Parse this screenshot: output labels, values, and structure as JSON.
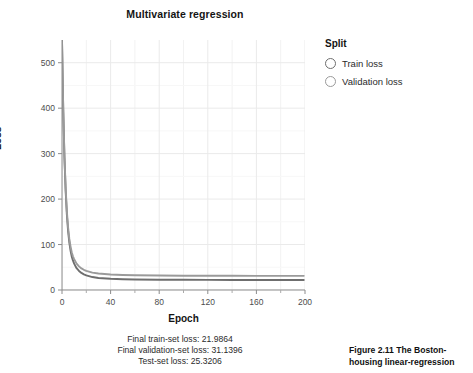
{
  "chart_data": {
    "type": "line",
    "title": "Multivariate regression",
    "xlabel": "Epoch",
    "ylabel": "Loss",
    "xlim": [
      0,
      200
    ],
    "ylim": [
      0,
      550
    ],
    "grid": true,
    "legend_position": "right",
    "legend_title": "Split",
    "x_ticks": [
      "0",
      "40",
      "80",
      "120",
      "160",
      "200"
    ],
    "x_tick_values": [
      0,
      40,
      80,
      120,
      160,
      200
    ],
    "x_minor_tick_values": [
      20,
      60,
      100,
      140,
      180
    ],
    "y_ticks": [
      "0",
      "100",
      "200",
      "300",
      "400",
      "500"
    ],
    "y_tick_values": [
      0,
      100,
      200,
      300,
      400,
      500
    ],
    "series": [
      {
        "name": "Train loss",
        "color": "#6e6e6e",
        "marker": "open-circle",
        "x": [
          0,
          1,
          2,
          3,
          4,
          5,
          6,
          7,
          8,
          9,
          10,
          12,
          14,
          16,
          18,
          20,
          25,
          30,
          40,
          50,
          60,
          80,
          100,
          120,
          140,
          160,
          180,
          199
        ],
        "values": [
          550,
          398,
          292,
          218,
          166,
          130,
          105,
          87,
          74,
          65,
          58,
          48,
          42,
          37.5,
          34.5,
          32.2,
          28.5,
          26.5,
          24.6,
          23.7,
          23.2,
          22.7,
          22.4,
          22.2,
          22.1,
          22.0,
          21.99,
          21.9864
        ]
      },
      {
        "name": "Validation loss",
        "color": "#9a9a9a",
        "marker": "open-circle",
        "x": [
          0,
          1,
          2,
          3,
          4,
          5,
          6,
          7,
          8,
          9,
          10,
          12,
          14,
          16,
          18,
          20,
          25,
          30,
          40,
          50,
          60,
          80,
          100,
          120,
          140,
          160,
          180,
          199
        ],
        "values": [
          548,
          400,
          296,
          224,
          173,
          138,
          113,
          96,
          83,
          74,
          68,
          58,
          52,
          47.5,
          44.5,
          42.2,
          38.2,
          36.2,
          34.1,
          33.0,
          32.4,
          31.8,
          31.5,
          31.35,
          31.25,
          31.18,
          31.15,
          31.1396
        ]
      }
    ]
  },
  "chart": {
    "title": "Multivariate regression",
    "x_axis_title": "Epoch",
    "y_axis_title": "Loss"
  },
  "legend": {
    "title": "Split",
    "items": [
      {
        "label": "Train loss",
        "color": "#6e6e6e"
      },
      {
        "label": "Validation loss",
        "color": "#9a9a9a"
      }
    ]
  },
  "summary": {
    "lines": [
      "Final train-set loss: 21.9864",
      "Final validation-set loss: 31.1396",
      "Test-set loss: 25.3206"
    ]
  },
  "book_caption": {
    "number": "Figure 2.11",
    "text": "The Boston-housing linear-regression"
  },
  "colors": {
    "train": "#6e6e6e",
    "validation": "#9a9a9a",
    "grid": "#ebebeb",
    "axis": "#999999",
    "text": "#1a1a1a"
  }
}
